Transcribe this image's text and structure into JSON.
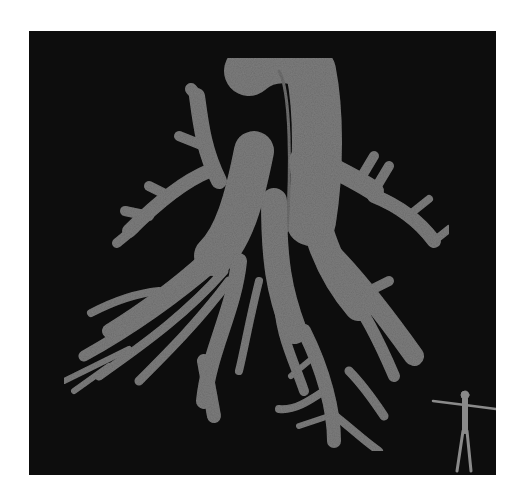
{
  "figure": {
    "background_color": "#ffffff",
    "panel_color": "#0d0d0d",
    "structure_color": "#6e6e6e",
    "structure_highlight": "#7c7c7c",
    "orientation_marker": {
      "icon": "human-figure-icon",
      "color": "#8a8a8a",
      "position": "bottom-right"
    }
  }
}
